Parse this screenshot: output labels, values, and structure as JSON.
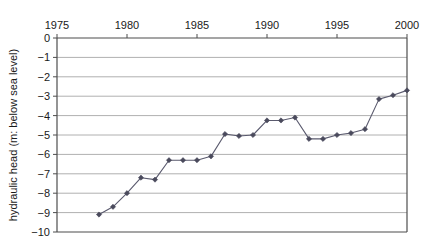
{
  "chart_data": {
    "type": "line",
    "title": "",
    "subtitle": "",
    "xlabel": "",
    "ylabel": "hydraulic head (m: below sea level)",
    "xlim": [
      1975,
      2000
    ],
    "ylim": [
      -10,
      0
    ],
    "xticks": [
      1975,
      1980,
      1985,
      1990,
      1995,
      2000
    ],
    "xtick_labels": [
      "1975",
      "1980",
      "1985",
      "1990",
      "1995",
      "2000"
    ],
    "yticks": [
      0,
      -1,
      -2,
      -3,
      -4,
      -5,
      -6,
      -7,
      -8,
      -9,
      -10
    ],
    "ytick_labels": [
      "0",
      "−1",
      "−2",
      "−3",
      "−4",
      "−5",
      "−6",
      "−7",
      "−8",
      "−9",
      "−10"
    ],
    "grid": "horizontal",
    "legend": "none",
    "x_axis_position": "top",
    "marker": "diamond",
    "series": [
      {
        "name": "hydraulic head",
        "color": "#5a5a6e",
        "x": [
          1978,
          1979,
          1980,
          1981,
          1982,
          1983,
          1984,
          1985,
          1986,
          1987,
          1988,
          1989,
          1990,
          1991,
          1992,
          1993,
          1994,
          1995,
          1996,
          1997,
          1998,
          1999,
          2000
        ],
        "values": [
          -9.1,
          -8.7,
          -8.0,
          -7.2,
          -7.3,
          -6.3,
          -6.3,
          -6.3,
          -6.1,
          -4.95,
          -5.05,
          -5.0,
          -4.25,
          -4.25,
          -4.1,
          -5.2,
          -5.2,
          -5.0,
          -4.9,
          -4.7,
          -3.15,
          -2.95,
          -2.7
        ]
      }
    ]
  },
  "style": {
    "grid_color": "#b0b0b0",
    "axis_color": "#4d4d4d",
    "line_color": "#6b6b7d",
    "marker_color": "#4a4a5c",
    "background": "#ffffff",
    "text_color": "#1a1a1a"
  }
}
